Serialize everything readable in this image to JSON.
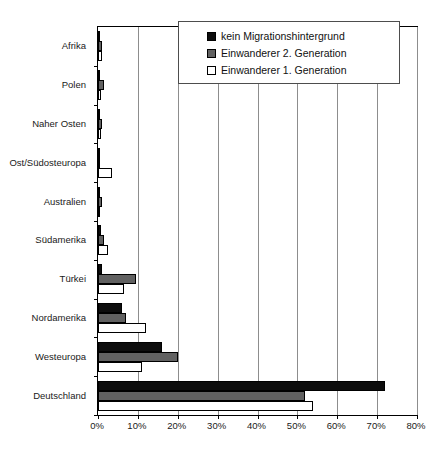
{
  "chart_data": {
    "type": "bar",
    "orientation": "horizontal",
    "title": "",
    "xlabel": "",
    "ylabel": "",
    "xlim": [
      0,
      80
    ],
    "xunit": "%",
    "grid": true,
    "legend_position": "top-right",
    "xticks": [
      "0%",
      "10%",
      "20%",
      "30%",
      "40%",
      "50%",
      "60%",
      "70%",
      "80%"
    ],
    "xtick_values": [
      0,
      10,
      20,
      30,
      40,
      50,
      60,
      70,
      80
    ],
    "categories": [
      "Afrika",
      "Polen",
      "Naher Osten",
      "Ost/Südosteuropa",
      "Australien",
      "Südamerika",
      "Türkei",
      "Nordamerika",
      "Westeuropa",
      "Deutschland"
    ],
    "series": [
      {
        "name": "kein Migrationshintergrund",
        "color": "#0d0d0d",
        "values": [
          0.4,
          0.3,
          0.5,
          0.6,
          0.5,
          0.7,
          1.0,
          6.0,
          16.0,
          72.0
        ]
      },
      {
        "name": "Einwanderer 2. Generation",
        "color": "#616161",
        "values": [
          0.9,
          1.4,
          1.1,
          0.4,
          1.0,
          1.5,
          9.5,
          7.0,
          20.0,
          52.0
        ]
      },
      {
        "name": "Einwanderer 1. Generation",
        "color": "#ffffff",
        "values": [
          1.1,
          0.7,
          0.7,
          3.6,
          0.4,
          2.6,
          6.5,
          12.0,
          11.0,
          54.0
        ]
      }
    ]
  },
  "legend": {
    "entries": [
      "kein Migrationshintergrund",
      "Einwanderer 2. Generation",
      "Einwanderer 1. Generation"
    ]
  },
  "caption": ""
}
